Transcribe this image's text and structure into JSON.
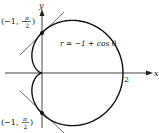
{
  "figure": {
    "equation": "r = −1 + cos θ",
    "x_axis_label": "x",
    "y_axis_label": "y",
    "x_tick_label": "2",
    "top_point": {
      "r": "−1",
      "theta": "−π/2",
      "prefix": "(−1, −",
      "num": "π",
      "den": "2",
      "suffix": ")"
    },
    "bottom_point": {
      "r": "−1",
      "theta": "π/2",
      "prefix": "(−1, ",
      "num": "π",
      "den": "2",
      "suffix": ")"
    },
    "colors": {
      "curve": "#111111",
      "axis": "#333333",
      "tangent": "#333333"
    }
  }
}
